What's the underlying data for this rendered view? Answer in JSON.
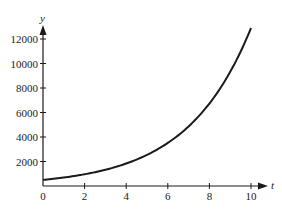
{
  "chart_data": {
    "type": "line",
    "title": "",
    "xlabel": "t",
    "ylabel": "y",
    "xlim": [
      0,
      10
    ],
    "ylim": [
      0,
      12800
    ],
    "grid": false,
    "legend": null,
    "x_ticks": [
      0,
      2,
      4,
      6,
      8,
      10
    ],
    "x_tick_labels": [
      "0",
      "2",
      "4",
      "6",
      "8",
      "10"
    ],
    "y_ticks": [
      2000,
      4000,
      6000,
      8000,
      10000,
      12000
    ],
    "y_tick_labels": [
      "2000",
      "4000",
      "6000",
      "8000",
      "10000",
      "12000"
    ],
    "series": [
      {
        "name": "y(t)",
        "description": "exponential growth curve, approx y = 500·e^(0.325t)",
        "x": [
          0,
          1,
          2,
          3,
          4,
          5,
          6,
          7,
          8,
          9,
          10
        ],
        "values": [
          500,
          692,
          957,
          1325,
          1834,
          2538,
          3514,
          4864,
          6732,
          9318,
          12898
        ]
      }
    ]
  },
  "colors": {
    "line": "#1a1a1a",
    "axis": "#1a1a1a",
    "background": "#ffffff"
  }
}
